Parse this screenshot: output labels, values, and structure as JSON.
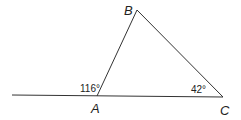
{
  "diagram": {
    "type": "triangle-with-exterior-angle",
    "vertices": {
      "A": {
        "label": "A",
        "x": 97,
        "y": 96
      },
      "B": {
        "label": "B",
        "x": 137,
        "y": 10
      },
      "C": {
        "label": "C",
        "x": 223,
        "y": 97
      }
    },
    "extended_line_start": {
      "x": 12,
      "y": 95
    },
    "angles": {
      "exterior_A": "116°",
      "C": "42°"
    },
    "line_color": "#333333"
  }
}
